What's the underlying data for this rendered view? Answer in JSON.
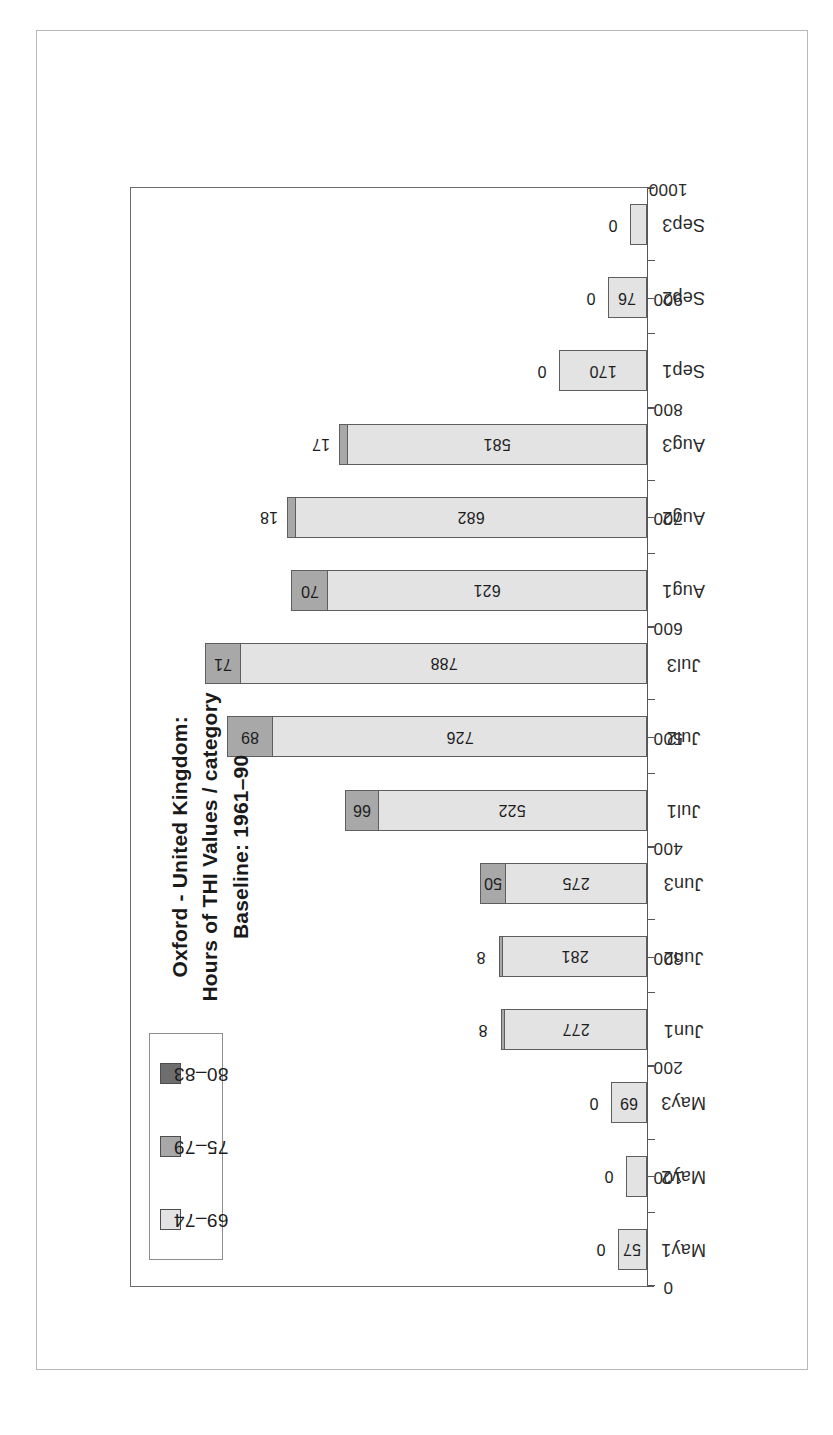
{
  "chart_data": {
    "type": "bar",
    "orientation": "horizontal",
    "stacked": true,
    "title_lines": [
      "Oxford - United Kingdom:",
      "Hours of THI Values / category",
      "Baseline: 1961–90"
    ],
    "xlabel": "",
    "ylabel": "",
    "categories": [
      "May1",
      "May2",
      "May3",
      "Jun1",
      "Jun2",
      "Jun3",
      "Jul1",
      "Jul2",
      "Jul3",
      "Aug1",
      "Aug2",
      "Aug3",
      "Sep1",
      "Sep2",
      "Sep3"
    ],
    "series": [
      {
        "name": "69–74",
        "color": "#e3e3e3",
        "values": [
          57,
          40,
          69,
          277,
          281,
          275,
          522,
          726,
          788,
          621,
          682,
          581,
          170,
          76,
          33
        ]
      },
      {
        "name": "75–79",
        "color": "#a8a8a8",
        "values": [
          0,
          0,
          0,
          8,
          8,
          50,
          66,
          89,
          71,
          70,
          18,
          17,
          0,
          0,
          0
        ]
      },
      {
        "name": "80–83",
        "color": "#6e6e6e",
        "values": [
          0,
          0,
          0,
          0,
          0,
          0,
          0,
          0,
          0,
          0,
          0,
          0,
          0,
          0,
          0
        ]
      }
    ],
    "axis": {
      "ticks": [
        0,
        100,
        200,
        300,
        400,
        500,
        600,
        700,
        800,
        900,
        1000
      ],
      "tick_labels": [
        "0",
        "100",
        "200",
        "300",
        "400",
        "500",
        "600",
        "700",
        "800",
        "900",
        "1000"
      ],
      "min": 0,
      "max": 1000,
      "grid": false,
      "direction": "0 at axis origin, increasing away from category labels"
    },
    "legend": {
      "position": "top-left inside plot",
      "entries": [
        {
          "label": "80–83",
          "color": "#6e6e6e"
        },
        {
          "label": "75–79",
          "color": "#a8a8a8"
        },
        {
          "label": "69–74",
          "color": "#e3e3e3"
        }
      ]
    },
    "bar_labels": [
      {
        "category": "May1",
        "primary": "57",
        "secondary": "0"
      },
      {
        "category": "May2",
        "primary": "40",
        "secondary": "0"
      },
      {
        "category": "May3",
        "primary": "69",
        "secondary": "0"
      },
      {
        "category": "Jun1",
        "primary": "277",
        "secondary": "8"
      },
      {
        "category": "Jun2",
        "primary": "281",
        "secondary": "8"
      },
      {
        "category": "Jun3",
        "primary": "275",
        "secondary": "50"
      },
      {
        "category": "Jul1",
        "primary": "522",
        "secondary": "66"
      },
      {
        "category": "Jul2",
        "primary": "726",
        "secondary": "89"
      },
      {
        "category": "Jul3",
        "primary": "788",
        "secondary": "71"
      },
      {
        "category": "Aug1",
        "primary": "621",
        "secondary": "70"
      },
      {
        "category": "Aug2",
        "primary": "682",
        "secondary": "18"
      },
      {
        "category": "Aug3",
        "primary": "581",
        "secondary": "17"
      },
      {
        "category": "Sep1",
        "primary": "170",
        "secondary": "0"
      },
      {
        "category": "Sep2",
        "primary": "76",
        "secondary": "0"
      },
      {
        "category": "Sep3",
        "primary": "33",
        "secondary": "0"
      }
    ]
  },
  "colors": {
    "cat_80_83": "#6e6e6e",
    "cat_75_79": "#a8a8a8",
    "cat_69_74": "#e3e3e3",
    "frame": "#6b6b6b",
    "page_border": "#b9b9b9",
    "text": "#1d1d1d"
  }
}
